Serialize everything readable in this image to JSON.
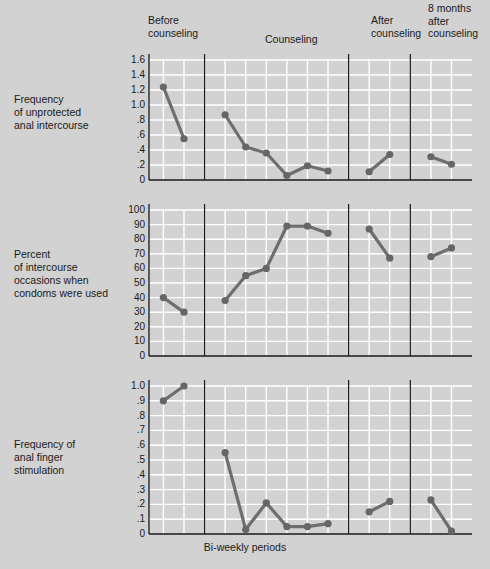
{
  "figure": {
    "background_color": "#d2d2d2",
    "grid_color": "#ffffff",
    "axis_color": "#1a1a1a",
    "series_color": "#6e6e6e",
    "marker_color": "#666666",
    "xlabel": "Bi-weekly periods"
  },
  "phases": [
    {
      "id": "before",
      "label": "Before\ncounseling",
      "points": 2
    },
    {
      "id": "during",
      "label": "Counseling",
      "points": 6
    },
    {
      "id": "after",
      "label": "After\ncounseling",
      "points": 2
    },
    {
      "id": "followup",
      "label": "8 months\nafter\ncounseling",
      "points": 2
    }
  ],
  "chart_data": [
    {
      "type": "line",
      "id": "panel-unprotected-intercourse",
      "title": "Frequency\nof unprotected\nanal intercourse",
      "ylabel": "Frequency of unprotected anal intercourse",
      "xlabel": "Bi-weekly periods",
      "ylim": [
        0,
        1.6
      ],
      "yticks": [
        0,
        0.2,
        0.4,
        0.6,
        0.8,
        1.0,
        1.2,
        1.4,
        1.6
      ],
      "ytick_labels": [
        "0",
        ".2",
        ".4",
        ".6",
        ".8",
        "1.0",
        "1.2",
        "1.4",
        "1.6"
      ],
      "grid": true,
      "legend": "none",
      "segments": [
        {
          "phase": "before",
          "x": [
            1,
            2
          ],
          "values": [
            1.24,
            0.55
          ]
        },
        {
          "phase": "during",
          "x": [
            4,
            5,
            6,
            7,
            8,
            9
          ],
          "values": [
            0.87,
            0.44,
            0.36,
            0.06,
            0.19,
            0.12
          ]
        },
        {
          "phase": "after",
          "x": [
            11,
            12
          ],
          "values": [
            0.11,
            0.34
          ]
        },
        {
          "phase": "followup",
          "x": [
            14,
            15
          ],
          "values": [
            0.31,
            0.21
          ]
        }
      ]
    },
    {
      "type": "line",
      "id": "panel-condom-use",
      "title": "Percent\nof intercourse\noccasions when\ncondoms were used",
      "ylabel": "Percent of intercourse occasions when condoms were used",
      "xlabel": "Bi-weekly periods",
      "ylim": [
        0,
        100
      ],
      "yticks": [
        0,
        10,
        20,
        30,
        40,
        50,
        60,
        70,
        80,
        90,
        100
      ],
      "ytick_labels": [
        "0",
        "10",
        "20",
        "30",
        "40",
        "50",
        "60",
        "70",
        "80",
        "90",
        "100"
      ],
      "grid": true,
      "legend": "none",
      "segments": [
        {
          "phase": "before",
          "x": [
            1,
            2
          ],
          "values": [
            40,
            30
          ]
        },
        {
          "phase": "during",
          "x": [
            4,
            5,
            6,
            7,
            8,
            9
          ],
          "values": [
            38,
            55,
            60,
            89,
            89,
            84
          ]
        },
        {
          "phase": "after",
          "x": [
            11,
            12
          ],
          "values": [
            87,
            67
          ]
        },
        {
          "phase": "followup",
          "x": [
            14,
            15
          ],
          "values": [
            68,
            74
          ]
        }
      ]
    },
    {
      "type": "line",
      "id": "panel-finger-stimulation",
      "title": "Frequency of\nanal finger\nstimulation",
      "ylabel": "Frequency of anal finger stimulation",
      "xlabel": "Bi-weekly periods",
      "ylim": [
        0,
        1.0
      ],
      "yticks": [
        0,
        0.1,
        0.2,
        0.3,
        0.4,
        0.5,
        0.6,
        0.7,
        0.8,
        0.9,
        1.0
      ],
      "ytick_labels": [
        "0",
        ".1",
        ".2",
        ".3",
        ".4",
        ".5",
        ".6",
        ".7",
        ".8",
        ".9",
        "1.0"
      ],
      "grid": true,
      "legend": "none",
      "segments": [
        {
          "phase": "before",
          "x": [
            1,
            2
          ],
          "values": [
            0.9,
            1.0
          ]
        },
        {
          "phase": "during",
          "x": [
            4,
            5,
            6,
            7,
            8,
            9
          ],
          "values": [
            0.55,
            0.03,
            0.21,
            0.05,
            0.05,
            0.07
          ]
        },
        {
          "phase": "after",
          "x": [
            11,
            12
          ],
          "values": [
            0.15,
            0.22
          ]
        },
        {
          "phase": "followup",
          "x": [
            14,
            15
          ],
          "values": [
            0.23,
            0.02
          ]
        }
      ]
    }
  ]
}
